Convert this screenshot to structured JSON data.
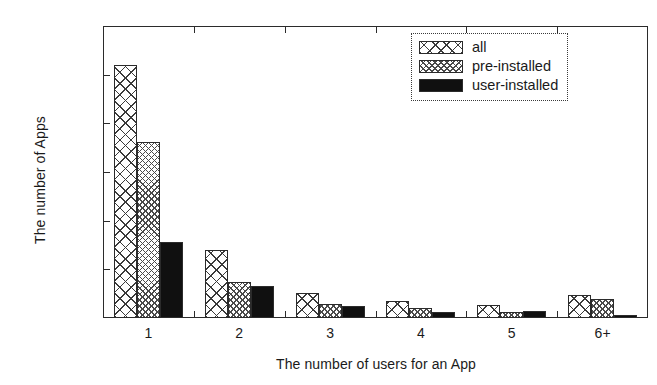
{
  "chart_data": {
    "type": "bar",
    "title": "",
    "xlabel": "The number of users for an App",
    "ylabel": "The number of Apps",
    "categories": [
      "1",
      "2",
      "3",
      "4",
      "5",
      "6+"
    ],
    "series": [
      {
        "name": "all",
        "values": [
          260,
          70,
          26,
          17,
          13,
          24
        ]
      },
      {
        "name": "pre-installed",
        "values": [
          181,
          37,
          14,
          10,
          6,
          20
        ]
      },
      {
        "name": "user-installed",
        "values": [
          78,
          33,
          12,
          6,
          7,
          3
        ]
      }
    ],
    "ylim": [
      0,
      300
    ],
    "yticks": [
      0,
      50,
      100,
      150,
      200,
      250,
      300
    ],
    "ytick_labels": [
      "0",
      "50",
      "100",
      "150",
      "200",
      "250",
      "300"
    ],
    "grid": false,
    "legend_position": "top-right",
    "colors": {
      "all": "#ffffff",
      "pre_installed": "#ffffff",
      "user_installed": "#101010",
      "axis": "#2b2b2b",
      "background": "#ffffff"
    }
  }
}
